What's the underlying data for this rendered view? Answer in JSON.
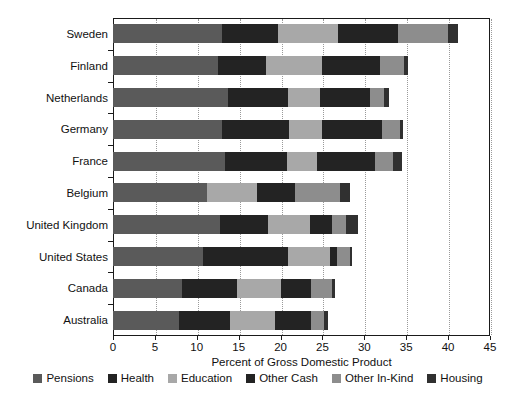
{
  "chart_data": {
    "type": "bar",
    "orientation": "horizontal",
    "stacked": true,
    "title": "",
    "subtitle": "",
    "xlabel": "Percent of Gross Domestic Product",
    "ylabel": "",
    "xlim": [
      0,
      45
    ],
    "xticks": [
      0,
      5,
      10,
      15,
      20,
      25,
      30,
      35,
      40,
      45
    ],
    "xtick_labels": [
      "0",
      "5",
      "10",
      "15",
      "20",
      "25",
      "30",
      "35",
      "40",
      "45"
    ],
    "grid": "vertical-dotted",
    "legend_position": "bottom",
    "categories": [
      "Sweden",
      "Finland",
      "Netherlands",
      "Germany",
      "France",
      "Belgium",
      "United Kingdom",
      "United States",
      "Canada",
      "Australia"
    ],
    "series": [
      {
        "name": "Pensions",
        "color": "#5a5a5a",
        "values": [
          13.0,
          12.5,
          13.7,
          13.0,
          13.4,
          11.2,
          12.8,
          10.7,
          8.2,
          7.9
        ]
      },
      {
        "name": "Health",
        "color": "#232323",
        "values": [
          6.7,
          5.8,
          7.2,
          8.0,
          7.4,
          0.0,
          5.7,
          10.2,
          6.6,
          6.1
        ]
      },
      {
        "name": "Education",
        "color": "#a8a8a8",
        "values": [
          7.2,
          6.7,
          3.8,
          4.0,
          3.5,
          6.0,
          5.0,
          5.0,
          5.2,
          5.3
        ]
      },
      {
        "name": "Other Cash",
        "color": "#232323",
        "values": [
          7.1,
          6.9,
          6.0,
          7.1,
          7.0,
          4.5,
          2.7,
          0.8,
          3.6,
          4.3
        ]
      },
      {
        "name": "Other In-Kind",
        "color": "#8d8d8d",
        "values": [
          6.0,
          2.8,
          1.7,
          2.1,
          2.1,
          5.4,
          1.6,
          1.6,
          2.5,
          1.6
        ]
      },
      {
        "name": "Housing",
        "color": "#303030",
        "values": [
          1.2,
          0.5,
          0.6,
          0.4,
          1.1,
          1.2,
          1.4,
          0.2,
          0.4,
          0.5
        ]
      }
    ],
    "totals": [
      41.2,
      35.2,
      33.0,
      34.6,
      34.5,
      28.3,
      29.2,
      28.5,
      26.5,
      25.7
    ]
  },
  "axis": {
    "x_title": "Percent of Gross Domestic Product"
  },
  "legend": {
    "items": [
      {
        "label": "Pensions",
        "color": "#5a5a5a"
      },
      {
        "label": "Health",
        "color": "#232323"
      },
      {
        "label": "Education",
        "color": "#a8a8a8"
      },
      {
        "label": "Other Cash",
        "color": "#232323"
      },
      {
        "label": "Other In-Kind",
        "color": "#8d8d8d"
      },
      {
        "label": "Housing",
        "color": "#303030"
      }
    ]
  }
}
